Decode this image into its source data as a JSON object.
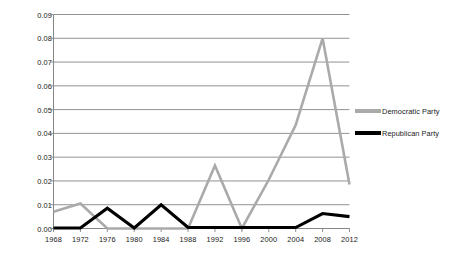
{
  "chart_data": {
    "type": "line",
    "title": "",
    "subtitle": "",
    "xlabel": "",
    "ylabel": "",
    "categories": [
      "1968",
      "1972",
      "1976",
      "1980",
      "1984",
      "1988",
      "1992",
      "1996",
      "2000",
      "2004",
      "2008",
      "2012"
    ],
    "x_tick_labels": [
      "1968",
      "1972",
      "1976",
      "1980",
      "1984",
      "1988",
      "1992",
      "1996",
      "2000",
      "2004",
      "2008",
      "2012"
    ],
    "y_tick_labels": [
      "0.00",
      "0.01",
      "0.02",
      "0.03",
      "0.04",
      "0.05",
      "0.06",
      "0.07",
      "0.08",
      "0.09"
    ],
    "y_tick_values": [
      0.0,
      0.01,
      0.02,
      0.03,
      0.04,
      0.05,
      0.06,
      0.07,
      0.08,
      0.09
    ],
    "ylim": [
      0,
      0.09
    ],
    "grid": "horizontal",
    "legend_position": "right",
    "series": [
      {
        "name": "Democratic Party",
        "color": "#aaaaaa",
        "values": [
          0.007,
          0.0105,
          0.0,
          0.0,
          0.0,
          0.0,
          0.0265,
          0.0,
          0.0205,
          0.0435,
          0.08,
          0.0185
        ]
      },
      {
        "name": "Republican Party",
        "color": "#000000",
        "values": [
          0.0002,
          0.0002,
          0.0085,
          0.0002,
          0.01,
          0.0004,
          0.0004,
          0.0004,
          0.0004,
          0.0004,
          0.0063,
          0.005
        ]
      }
    ]
  },
  "legend": {
    "items": [
      {
        "label": "Democratic Party",
        "color": "#aaaaaa"
      },
      {
        "label": "Republican Party",
        "color": "#000000"
      }
    ]
  },
  "axes": {
    "axis_color": "#868686",
    "grid_color": "#868686"
  }
}
